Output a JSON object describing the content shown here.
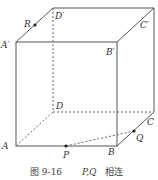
{
  "figure": {
    "caption_number": "图 9-16",
    "caption_math": "P,Q",
    "caption_text": "相连"
  },
  "vertices": {
    "A": {
      "label": "A",
      "x": 16,
      "y": 146
    },
    "B": {
      "label": "B",
      "x": 117,
      "y": 146
    },
    "C": {
      "label": "C",
      "x": 154,
      "y": 112
    },
    "D": {
      "label": "D",
      "x": 53,
      "y": 112
    },
    "A1": {
      "label": "A′",
      "x": 16,
      "y": 42
    },
    "B1": {
      "label": "B′",
      "x": 117,
      "y": 42
    },
    "C1": {
      "label": "C′",
      "x": 154,
      "y": 8
    },
    "D1": {
      "label": "D′",
      "x": 53,
      "y": 8
    }
  },
  "points": {
    "R": {
      "label": "R",
      "x": 35,
      "y": 25
    },
    "P": {
      "label": "P",
      "x": 66,
      "y": 146
    },
    "Q": {
      "label": "Q",
      "x": 134,
      "y": 131
    }
  },
  "colors": {
    "edge": "#555555",
    "hidden_edge": "#666666",
    "point": "#222222"
  }
}
